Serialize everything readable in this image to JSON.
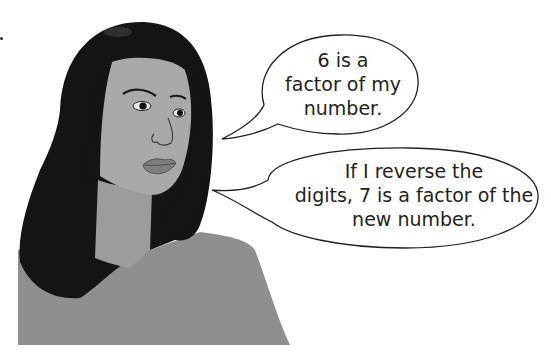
{
  "scene": {
    "description": "Illustration of a woman with long dark hair beside two speech bubbles",
    "colors": {
      "background": "#ffffff",
      "hair": "#141414",
      "skin": "#a9a9a9",
      "neck": "#9c9c9c",
      "shirt": "#8f8f8f",
      "lips": "#7e7e7e",
      "bubble_fill": "#ffffff",
      "bubble_stroke": "#231f20",
      "text": "#231f20"
    }
  },
  "speech_bubbles": [
    {
      "id": "bubble-1",
      "lines": [
        "6 is a",
        "factor of my",
        "number."
      ]
    },
    {
      "id": "bubble-2",
      "lines": [
        "If I reverse the",
        "digits, 7 is a factor of the",
        "new number."
      ]
    }
  ]
}
